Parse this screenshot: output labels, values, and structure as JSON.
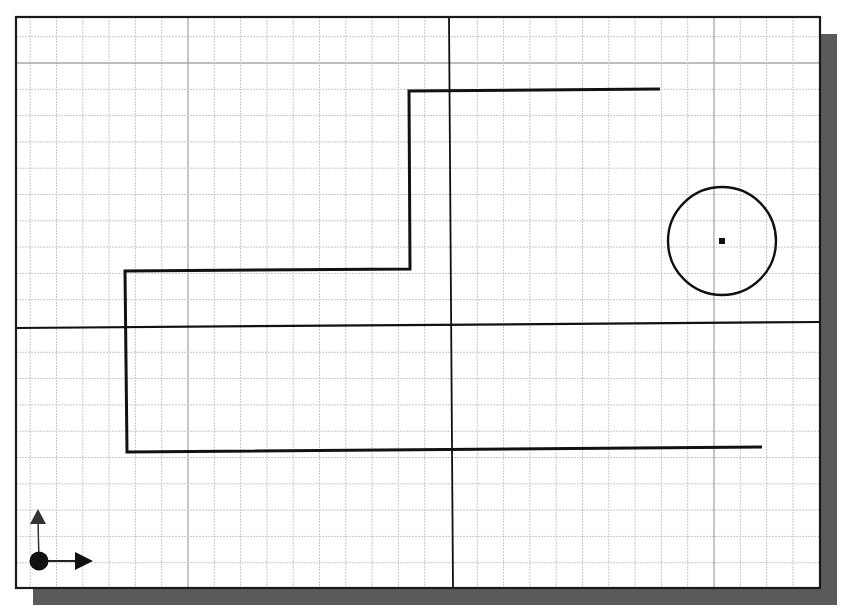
{
  "viewport": {
    "name": "cad-drawing-area",
    "frame": {
      "x": 16,
      "y": 17,
      "width": 804,
      "height": 571
    },
    "shadow_offset": {
      "dx": 17,
      "dy": 17
    },
    "colors": {
      "background": "#ffffff",
      "frame": "#1a1a1a",
      "shadow": "#5a5a5a",
      "grid_minor": "#c8c8c8",
      "grid_major": "#a8a8a8",
      "axis": "#111111",
      "geometry": "#111111"
    }
  },
  "grid": {
    "origin": {
      "x": 451,
      "y": 326
    },
    "spacing": 26.3,
    "major_every": 10
  },
  "axes": {
    "horizontal": {
      "y1": 328,
      "y2": 322
    },
    "vertical": {
      "x1": 449,
      "x2": 453
    }
  },
  "geometry": {
    "polyline": {
      "name": "step-polyline",
      "points": [
        [
          660,
          89
        ],
        [
          409,
          91
        ],
        [
          410,
          269
        ],
        [
          125,
          271
        ],
        [
          127,
          452
        ],
        [
          762,
          447
        ]
      ]
    },
    "circle": {
      "name": "circle",
      "cx": 722,
      "cy": 241,
      "r": 54,
      "center_marker": {
        "size": 6
      }
    }
  },
  "ucs_icon": {
    "name": "ucs-icon",
    "origin": {
      "x": 39,
      "y": 561
    },
    "y_arrow_tip": {
      "x": 38,
      "y": 509
    },
    "x_arrow_tip": {
      "x": 93,
      "y": 561
    }
  }
}
